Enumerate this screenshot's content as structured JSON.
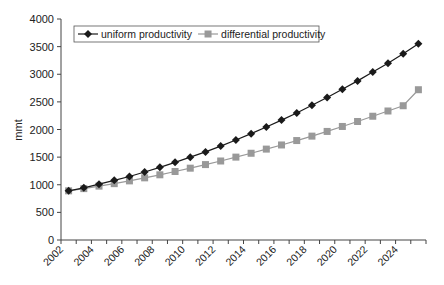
{
  "chart_data": {
    "type": "line",
    "title": "",
    "xlabel": "",
    "ylabel": "mmt",
    "ylim": [
      0,
      4000
    ],
    "yticks": [
      0,
      500,
      1000,
      1500,
      2000,
      2500,
      3000,
      3500,
      4000
    ],
    "x": [
      2002,
      2003,
      2004,
      2005,
      2006,
      2007,
      2008,
      2009,
      2010,
      2011,
      2012,
      2013,
      2014,
      2015,
      2016,
      2017,
      2018,
      2019,
      2020,
      2021,
      2022,
      2023,
      2024,
      2025
    ],
    "xtick_labels": [
      "2002",
      "2004",
      "2006",
      "2008",
      "2010",
      "2012",
      "2014",
      "2016",
      "2018",
      "2020",
      "2022",
      "2024"
    ],
    "grid": false,
    "legend_position": "top-left, inside plot, boxed, horizontal",
    "series": [
      {
        "name": "uniform productivity",
        "marker": "diamond",
        "color": "#1a1a1a",
        "values": [
          890,
          945,
          1010,
          1080,
          1150,
          1230,
          1315,
          1405,
          1500,
          1595,
          1700,
          1810,
          1925,
          2045,
          2170,
          2300,
          2440,
          2580,
          2730,
          2880,
          3040,
          3200,
          3370,
          3550
        ]
      },
      {
        "name": "differential productivity",
        "marker": "square",
        "color": "#999999",
        "values": [
          890,
          930,
          975,
          1020,
          1070,
          1125,
          1180,
          1240,
          1300,
          1365,
          1430,
          1500,
          1570,
          1645,
          1720,
          1800,
          1880,
          1965,
          2055,
          2145,
          2240,
          2335,
          2430,
          2720
        ]
      }
    ]
  }
}
